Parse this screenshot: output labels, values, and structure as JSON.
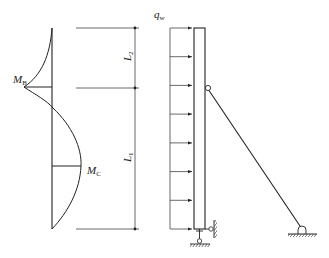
{
  "figure": {
    "moment_diagram": {
      "labels": {
        "mb": {
          "main": "M",
          "sub": "B"
        },
        "mc": {
          "main": "M",
          "sub": "C"
        }
      }
    },
    "dimensions": {
      "l2": {
        "main": "L",
        "sub": "2"
      },
      "l1": {
        "main": "L",
        "sub": "1"
      }
    },
    "load": {
      "label": {
        "main": "q",
        "sub": "w"
      },
      "arrow_count": 8
    },
    "colors": {
      "stroke": "#222222",
      "background": "#ffffff"
    }
  }
}
